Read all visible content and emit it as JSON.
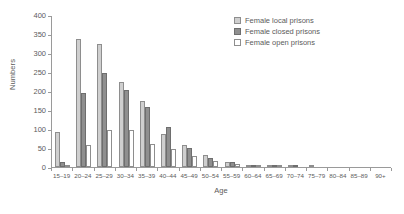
{
  "chart_data": {
    "type": "bar",
    "title": "",
    "xlabel": "Age",
    "ylabel": "Numbers",
    "ylim": [
      0,
      400
    ],
    "yticks": [
      0,
      50,
      100,
      150,
      200,
      250,
      300,
      350,
      400
    ],
    "grid": false,
    "legend_position": "top-right",
    "categories": [
      "15–19",
      "20–24",
      "25–29",
      "30–34",
      "35–39",
      "40–44",
      "45–49",
      "50–54",
      "55–59",
      "60–64",
      "65–69",
      "70–74",
      "75–79",
      "80–84",
      "85–89",
      "90+"
    ],
    "series": [
      {
        "name": "Female local prisons",
        "color": "#cfcfcf",
        "values": [
          92,
          337,
          323,
          224,
          175,
          86,
          57,
          31,
          12,
          5,
          2,
          1,
          1,
          0,
          0,
          0
        ]
      },
      {
        "name": "Female closed prisons",
        "color": "#8f8f8f",
        "values": [
          12,
          194,
          247,
          202,
          158,
          105,
          50,
          25,
          14,
          6,
          3,
          1,
          0,
          0,
          0,
          0
        ]
      },
      {
        "name": "Female open prisons",
        "color": "#ffffff",
        "values": [
          2,
          58,
          97,
          97,
          60,
          47,
          30,
          17,
          7,
          3,
          1,
          0,
          0,
          0,
          0,
          0
        ]
      }
    ]
  },
  "legend": {
    "items": [
      {
        "label": "Female local prisons",
        "swatch": "local"
      },
      {
        "label": "Female closed prisons",
        "swatch": "closed"
      },
      {
        "label": "Female open prisons",
        "swatch": "open"
      }
    ]
  }
}
